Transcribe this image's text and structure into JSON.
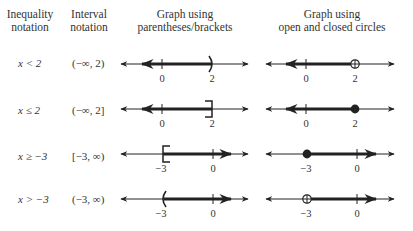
{
  "headers": {
    "inequality": [
      "Inequality",
      "notation"
    ],
    "interval": [
      "Interval",
      "notation"
    ],
    "brackets": [
      "Graph using",
      "parentheses/brackets"
    ],
    "circles": [
      "Graph using",
      "open and closed circles"
    ]
  },
  "rows": [
    {
      "inequality": "x < 2",
      "interval": "(−∞, 2)",
      "bracket_graph": {
        "endpoint": 2,
        "direction": "left",
        "symbol": ")",
        "labels": [
          "0",
          "2"
        ]
      },
      "circle_graph": {
        "endpoint": 2,
        "direction": "left",
        "circle": "open",
        "labels": [
          "0",
          "2"
        ]
      }
    },
    {
      "inequality": "x ≤ 2",
      "interval": "(−∞, 2]",
      "bracket_graph": {
        "endpoint": 2,
        "direction": "left",
        "symbol": "]",
        "labels": [
          "0",
          "2"
        ]
      },
      "circle_graph": {
        "endpoint": 2,
        "direction": "left",
        "circle": "closed",
        "labels": [
          "0",
          "2"
        ]
      }
    },
    {
      "inequality": "x ≥ −3",
      "interval": "[−3, ∞)",
      "bracket_graph": {
        "endpoint": -3,
        "direction": "right",
        "symbol": "[",
        "labels": [
          "−3",
          "0"
        ]
      },
      "circle_graph": {
        "endpoint": -3,
        "direction": "right",
        "circle": "closed",
        "labels": [
          "−3",
          "0"
        ]
      }
    },
    {
      "inequality": "x > −3",
      "interval": "(−3, ∞)",
      "bracket_graph": {
        "endpoint": -3,
        "direction": "right",
        "symbol": "(",
        "labels": [
          "−3",
          "0"
        ]
      },
      "circle_graph": {
        "endpoint": -3,
        "direction": "right",
        "circle": "open",
        "labels": [
          "−3",
          "0"
        ]
      }
    }
  ]
}
